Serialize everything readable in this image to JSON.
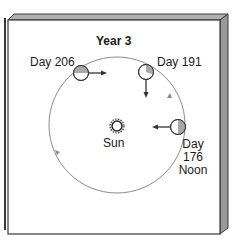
{
  "diagram": {
    "title": "Year 3",
    "sun": {
      "label": "Sun",
      "icon": "sun-icon"
    },
    "positions": [
      {
        "id": "day-206",
        "label": "Day 206",
        "arrow": "right"
      },
      {
        "id": "day-191",
        "label": "Day 191",
        "arrow": "down"
      },
      {
        "id": "day-176",
        "label_line1": "Day",
        "label_line2": "176",
        "label_line3": "Noon",
        "arrow": "left"
      }
    ],
    "colors": {
      "frame_border": "#3a3a3a",
      "frame_side": "#9a9a9a",
      "orbit": "#8a8a8a",
      "planet_shade": "#a8a8a8",
      "arrow": "#333333"
    }
  }
}
